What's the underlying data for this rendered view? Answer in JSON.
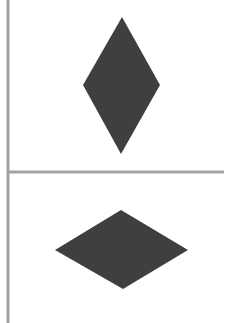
{
  "canvas": {
    "width": 230,
    "height": 323,
    "background": "#ffffff"
  },
  "colors": {
    "shape_fill": "#3f3f3f",
    "divider": "#a3a3a3"
  },
  "dividers": {
    "vertical": {
      "x": 8,
      "y1": 0,
      "y2": 323,
      "width": 3
    },
    "horizontal": {
      "y": 172,
      "x1": 8,
      "x2": 224,
      "width": 3
    }
  },
  "panels": [
    {
      "name": "top-panel",
      "shape": "diamond",
      "orientation": "vertical",
      "points": {
        "top": [
          122,
          17
        ],
        "right": [
          160,
          85
        ],
        "bottom": [
          121,
          154
        ],
        "left": [
          83,
          85
        ]
      }
    },
    {
      "name": "bottom-panel",
      "shape": "diamond",
      "orientation": "horizontal",
      "points": {
        "top": [
          121,
          210
        ],
        "right": [
          188,
          250
        ],
        "bottom": [
          123,
          289
        ],
        "left": [
          55,
          250
        ]
      }
    }
  ]
}
